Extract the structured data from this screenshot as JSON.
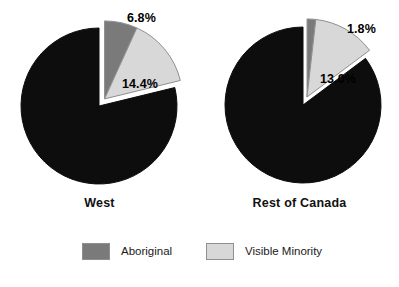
{
  "chart_data": {
    "type": "pie",
    "title": "",
    "subtitle": "",
    "xlabel": "",
    "ylabel": "",
    "legend_position": "bottom",
    "grid": false,
    "categories": [
      "Aboriginal",
      "Visible Minority",
      "Other"
    ],
    "colors": {
      "aboriginal": "#7a7a7a",
      "visible_minority": "#d8d8d8",
      "other": "#0d0d0d",
      "background": "#ffffff",
      "outline": "#8f8f8f",
      "explode_outline": "#ffffff",
      "text": "#111111"
    },
    "legend": [
      {
        "label": "Aboriginal",
        "color": "#7a7a7a"
      },
      {
        "label": "Visible Minority",
        "color": "#d8d8d8"
      }
    ],
    "pies": [
      {
        "name": "West",
        "caption": "West",
        "center": [
          99,
          106
        ],
        "radius": 78,
        "slices": [
          {
            "category": "Aboriginal",
            "value": 6.8,
            "label": "6.8%",
            "color": "#7a7a7a",
            "exploded": true
          },
          {
            "category": "Visible Minority",
            "value": 14.4,
            "label": "14.4%",
            "color": "#d8d8d8",
            "exploded": true
          },
          {
            "category": "Other",
            "value": 78.8,
            "label": "",
            "color": "#0d0d0d",
            "exploded": false
          }
        ]
      },
      {
        "name": "Rest of Canada",
        "caption": "Rest of Canada",
        "center": [
          303,
          105
        ],
        "radius": 78,
        "slices": [
          {
            "category": "Aboriginal",
            "value": 1.8,
            "label": "1.8%",
            "color": "#7a7a7a",
            "exploded": true
          },
          {
            "category": "Visible Minority",
            "value": 13.0,
            "label": "13.0%",
            "color": "#d8d8d8",
            "exploded": true
          },
          {
            "category": "Other",
            "value": 85.2,
            "label": "",
            "color": "#0d0d0d",
            "exploded": false
          }
        ]
      }
    ]
  },
  "captions": {
    "west": "West",
    "rest_of_canada": "Rest of Canada"
  },
  "percent_labels": {
    "west_aboriginal": "6.8%",
    "west_visible": "14.4%",
    "rest_aboriginal": "1.8%",
    "rest_visible": "13.0%"
  },
  "legend": {
    "aboriginal_label": "Aboriginal",
    "visible_minority_label": "Visible Minority"
  }
}
